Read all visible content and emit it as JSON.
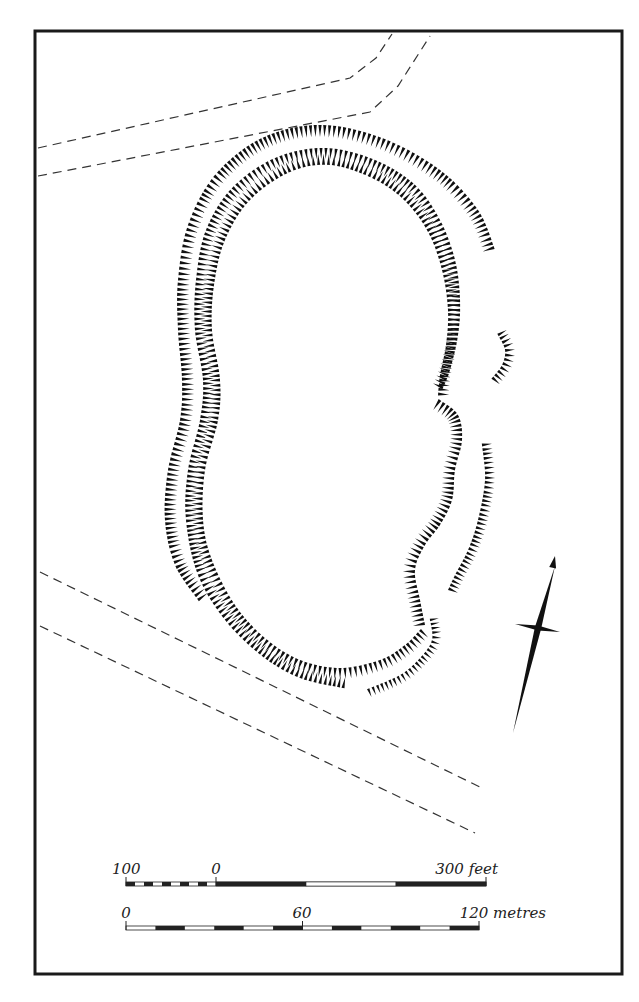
{
  "figure": {
    "type": "archaeological earthwork plan (hachured enclosure)",
    "frame": {
      "x": 35,
      "y": 31,
      "width": 587,
      "height": 943
    }
  },
  "tracks": [
    {
      "name": "track-north-upper",
      "points": [
        [
          38,
          148
        ],
        [
          350,
          78
        ],
        [
          376,
          58
        ],
        [
          392,
          34
        ]
      ]
    },
    {
      "name": "track-north-lower",
      "points": [
        [
          38,
          176
        ],
        [
          80,
          168
        ],
        [
          370,
          112
        ],
        [
          398,
          86
        ],
        [
          430,
          36
        ]
      ]
    },
    {
      "name": "track-south-upper",
      "points": [
        [
          40,
          572
        ],
        [
          484,
          789
        ]
      ]
    },
    {
      "name": "track-south-lower",
      "points": [
        [
          40,
          626
        ],
        [
          475,
          833
        ]
      ]
    }
  ],
  "ramparts": [
    {
      "name": "outer-rampart-west-south",
      "points": [
        [
          198,
          600
        ],
        [
          175,
          565
        ],
        [
          165,
          520
        ],
        [
          168,
          470
        ],
        [
          180,
          420
        ],
        [
          182,
          380
        ],
        [
          178,
          330
        ],
        [
          178,
          280
        ],
        [
          188,
          225
        ],
        [
          215,
          175
        ],
        [
          262,
          138
        ],
        [
          320,
          125
        ],
        [
          382,
          138
        ],
        [
          440,
          170
        ],
        [
          478,
          210
        ],
        [
          495,
          250
        ]
      ],
      "len": 12,
      "width": 3.2,
      "spacing": 4.6,
      "side": 1
    },
    {
      "name": "middle-rampart",
      "points": [
        [
          343,
          688
        ],
        [
          300,
          678
        ],
        [
          262,
          656
        ],
        [
          225,
          620
        ],
        [
          198,
          575
        ],
        [
          186,
          520
        ],
        [
          188,
          470
        ],
        [
          200,
          420
        ],
        [
          203,
          380
        ],
        [
          195,
          330
        ],
        [
          196,
          280
        ],
        [
          206,
          230
        ],
        [
          232,
          188
        ],
        [
          275,
          158
        ],
        [
          325,
          148
        ],
        [
          375,
          160
        ],
        [
          415,
          185
        ],
        [
          440,
          220
        ],
        [
          455,
          260
        ],
        [
          460,
          300
        ],
        [
          458,
          335
        ],
        [
          450,
          370
        ],
        [
          442,
          390
        ]
      ],
      "len": 11,
      "width": 3.0,
      "spacing": 4.4,
      "side": 1
    },
    {
      "name": "inner-rampart",
      "points": [
        [
          420,
          630
        ],
        [
          405,
          645
        ],
        [
          380,
          660
        ],
        [
          340,
          668
        ],
        [
          300,
          660
        ],
        [
          265,
          638
        ],
        [
          235,
          605
        ],
        [
          212,
          560
        ],
        [
          203,
          520
        ],
        [
          205,
          470
        ],
        [
          218,
          420
        ],
        [
          220,
          380
        ],
        [
          212,
          330
        ],
        [
          214,
          285
        ],
        [
          225,
          240
        ],
        [
          250,
          200
        ],
        [
          290,
          172
        ],
        [
          330,
          165
        ],
        [
          372,
          178
        ],
        [
          404,
          200
        ],
        [
          428,
          232
        ],
        [
          442,
          270
        ],
        [
          448,
          310
        ],
        [
          446,
          345
        ],
        [
          440,
          375
        ],
        [
          438,
          395
        ]
      ],
      "len": 11,
      "width": 3.0,
      "spacing": 4.4,
      "side": -1
    },
    {
      "name": "inner-rampart-east",
      "points": [
        [
          440,
          400
        ],
        [
          458,
          415
        ],
        [
          462,
          440
        ],
        [
          455,
          470
        ],
        [
          452,
          500
        ],
        [
          440,
          525
        ],
        [
          425,
          545
        ],
        [
          415,
          570
        ],
        [
          420,
          600
        ],
        [
          425,
          625
        ]
      ],
      "len": 12,
      "width": 3.2,
      "spacing": 4.6,
      "side": 1
    },
    {
      "name": "outer-rampart-east-upper",
      "points": [
        [
          498,
          335
        ],
        [
          505,
          350
        ],
        [
          502,
          365
        ],
        [
          492,
          378
        ]
      ],
      "len": 10,
      "width": 3.0,
      "spacing": 4.2,
      "side": -1
    },
    {
      "name": "outer-rampart-east-lower",
      "points": [
        [
          482,
          445
        ],
        [
          485,
          480
        ],
        [
          478,
          520
        ],
        [
          468,
          550
        ],
        [
          455,
          575
        ],
        [
          448,
          590
        ]
      ],
      "len": 10,
      "width": 3.0,
      "spacing": 4.2,
      "side": -1
    },
    {
      "name": "outer-rampart-south-east",
      "points": [
        [
          430,
          620
        ],
        [
          432,
          640
        ],
        [
          420,
          658
        ],
        [
          400,
          675
        ],
        [
          365,
          690
        ]
      ],
      "len": 9,
      "width": 2.6,
      "spacing": 4.2,
      "side": -1
    }
  ],
  "north_arrow": {
    "label": "north-arrow",
    "tip": [
      555,
      558
    ],
    "tail": [
      513,
      733
    ],
    "cross_left": [
      515,
      624
    ],
    "cross_right": [
      560,
      632
    ],
    "center": [
      538,
      628
    ]
  },
  "scale_bars": [
    {
      "name": "scale-feet",
      "x0": 126,
      "x1": 486,
      "y": 882,
      "height": 4,
      "labels": [
        {
          "text": "100",
          "x": 112,
          "anchor": "start"
        },
        {
          "text": "0",
          "x": 216,
          "anchor": "middle"
        },
        {
          "text": "300 feet",
          "x": 498,
          "anchor": "end"
        }
      ],
      "zero_x": 216,
      "subdivision_segments": 10,
      "main_segments": [
        [
          "#222",
          216,
          306
        ],
        [
          "#fff",
          306,
          396
        ],
        [
          "#222",
          396,
          486
        ]
      ]
    },
    {
      "name": "scale-metres",
      "x0": 126,
      "x1": 479,
      "y": 926,
      "height": 4,
      "labels": [
        {
          "text": "0",
          "x": 126,
          "anchor": "middle"
        },
        {
          "text": "60",
          "x": 302,
          "anchor": "middle"
        },
        {
          "text": "120 metres",
          "x": 546,
          "anchor": "end"
        }
      ],
      "segments_count": 12
    }
  ]
}
